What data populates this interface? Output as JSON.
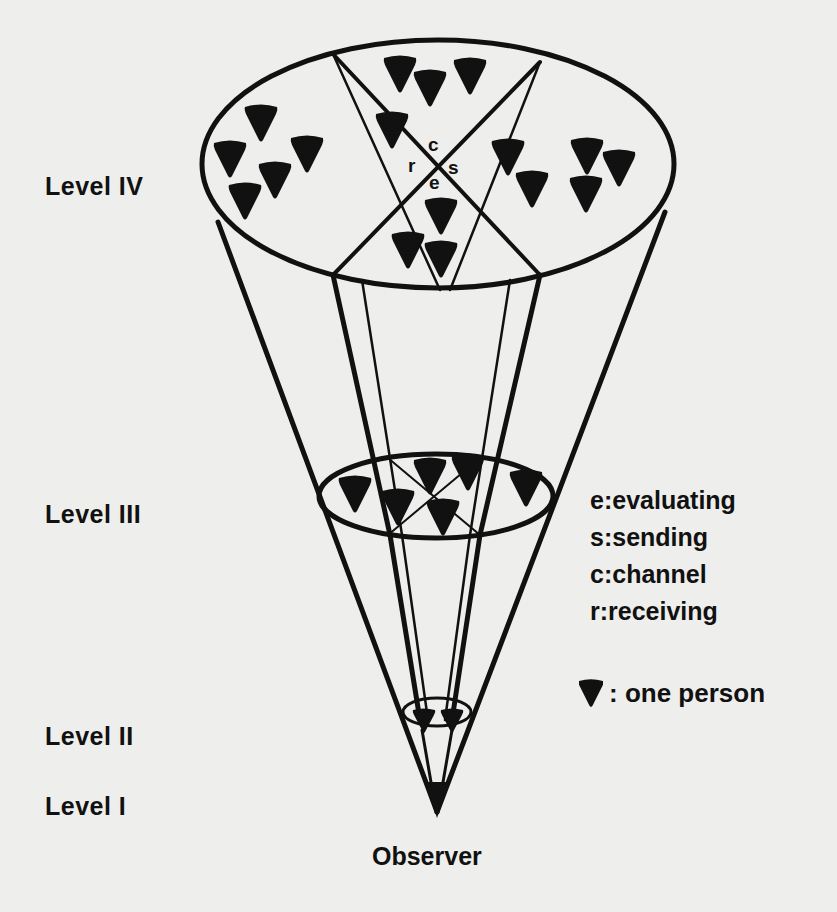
{
  "levels": [
    {
      "id": "IV",
      "label": "Level IV"
    },
    {
      "id": "III",
      "label": "Level III"
    },
    {
      "id": "II",
      "label": "Level II"
    },
    {
      "id": "I",
      "label": "Level I"
    }
  ],
  "observer_label": "Observer",
  "center_letters": {
    "c": "c",
    "r": "r",
    "s": "s",
    "e": "e"
  },
  "legend": {
    "items": [
      {
        "key": "e",
        "text": "e:evaluating"
      },
      {
        "key": "s",
        "text": "s:sending"
      },
      {
        "key": "c",
        "text": "c:channel"
      },
      {
        "key": "r",
        "text": "r:receiving"
      }
    ],
    "person_symbol": "person-icon",
    "person_text": ": one person"
  },
  "person_counts": {
    "level_IV": 21,
    "level_III": 6,
    "level_II": 2,
    "level_I": 1
  },
  "colors": {
    "ink": "#111111",
    "paper": "#eeeeec"
  }
}
